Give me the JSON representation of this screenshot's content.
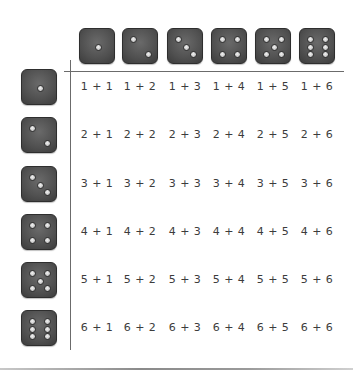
{
  "column_header_dice": [
    1,
    2,
    3,
    4,
    5,
    6
  ],
  "row_header_dice": [
    1,
    2,
    3,
    4,
    5,
    6
  ],
  "rows": [
    [
      "1 + 1",
      "1 + 2",
      "1 + 3",
      "1 + 4",
      "1 + 5",
      "1 + 6"
    ],
    [
      "2 + 1",
      "2 + 2",
      "2 + 3",
      "2 + 4",
      "2 + 5",
      "2 + 6"
    ],
    [
      "3 + 1",
      "3 + 2",
      "3 + 3",
      "3 + 4",
      "3 + 5",
      "3 + 6"
    ],
    [
      "4 + 1",
      "4 + 2",
      "4 + 3",
      "4 + 4",
      "4 + 5",
      "4 + 6"
    ],
    [
      "5 + 1",
      "5 + 2",
      "5 + 3",
      "5 + 4",
      "5 + 5",
      "5 + 6"
    ],
    [
      "6 + 1",
      "6 + 2",
      "6 + 3",
      "6 + 4",
      "6 + 5",
      "6 + 6"
    ]
  ],
  "colors": {
    "die_face": "#505050",
    "pip": "#d8d8d8",
    "text": "#3c3c3c",
    "grid_line": "#6b6b6b"
  }
}
